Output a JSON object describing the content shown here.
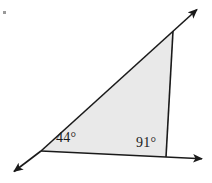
{
  "figure": {
    "kind": "triangle-with-extended-rays",
    "background_color": "#ffffff",
    "fill_color": "#e9e9e9",
    "stroke_color": "#1a1a1a",
    "stroke_width": 1.6,
    "corner_dot": {
      "name": "corner-dot",
      "x": 4,
      "y": 12,
      "size": 3,
      "color": "#9a9a9a"
    },
    "vertices": {
      "left": {
        "label": "A",
        "x": 41,
        "y": 151
      },
      "top_right": {
        "label": "B",
        "x": 173,
        "y": 31
      },
      "bottom_right": {
        "label": "C",
        "x": 166,
        "y": 157
      }
    },
    "rays": [
      {
        "name": "ray-upper-right",
        "from_x": 41,
        "from_y": 151,
        "to_x": 199,
        "to_y": 8,
        "arrow_at": "end"
      },
      {
        "name": "ray-lower-left",
        "from_x": 41,
        "from_y": 151,
        "to_x": 12,
        "to_y": 173,
        "arrow_at": "end"
      },
      {
        "name": "ray-base-right",
        "from_x": 41,
        "from_y": 151,
        "to_x": 205,
        "to_y": 159,
        "arrow_at": "end"
      },
      {
        "name": "segment-right-side",
        "from_x": 173,
        "from_y": 31,
        "to_x": 166,
        "to_y": 157,
        "arrow_at": "none"
      }
    ],
    "labels": {
      "angle_a": {
        "text": "44°",
        "value": 44,
        "unit": "degrees",
        "at_vertex": "left"
      },
      "angle_b": {
        "text": "91°",
        "value": 91,
        "unit": "degrees",
        "at_vertex": "bottom_right"
      }
    }
  }
}
